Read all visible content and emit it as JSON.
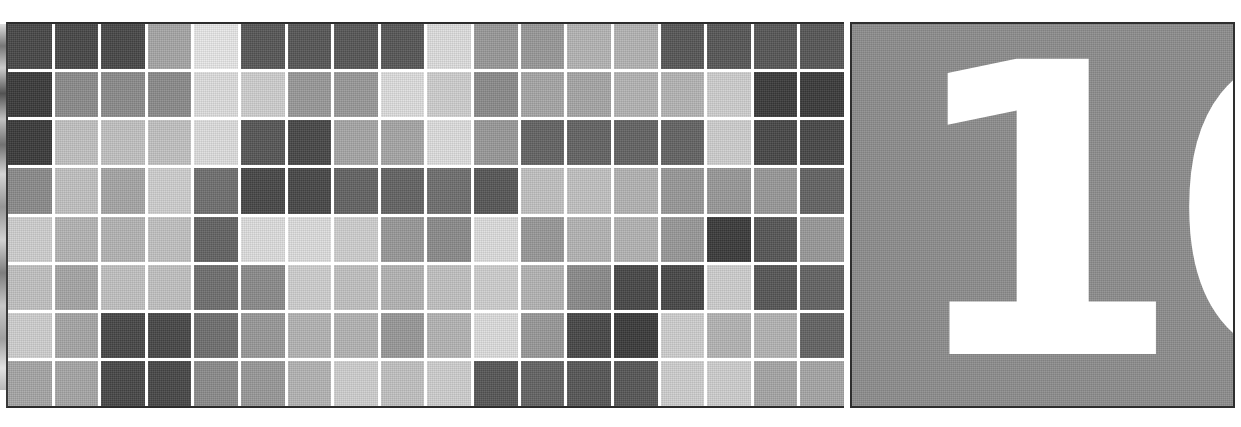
{
  "page": {
    "kind": "chapter-divider",
    "background_color": "#ffffff"
  },
  "number_panel": {
    "chapter_number": "10",
    "panel_color": "#8d8d8d",
    "number_color": "#ffffff",
    "border_color": "#2e2e2e"
  },
  "mosaic": {
    "columns": 18,
    "rows": 8,
    "gap_color": "#ffffff",
    "border_color": "#2c2c2c",
    "palette": {
      "1": "#474747",
      "2": "#565656",
      "3": "#636363",
      "4": "#6f6f6f",
      "5": "#7d7d7d",
      "6": "#8b8b8b",
      "7": "#999999",
      "8": "#a6a6a6",
      "9": "#b4b4b4",
      "10": "#c2c2c2",
      "11": "#d0d0d0",
      "12": "#dedede",
      "13": "#3a3a3a",
      "14": "#e8e8e8"
    },
    "rows_data": [
      [
        "1",
        "1",
        "1",
        "8",
        "14",
        "2",
        "2",
        "2",
        "2",
        "12",
        "7",
        "7",
        "9",
        "9",
        "2",
        "2",
        "2",
        "2"
      ],
      [
        "13",
        "6",
        "6",
        "6",
        "12",
        "11",
        "7",
        "7",
        "12",
        "11",
        "6",
        "8",
        "8",
        "9",
        "9",
        "11",
        "13",
        "13"
      ],
      [
        "13",
        "10",
        "10",
        "10",
        "12",
        "2",
        "1",
        "8",
        "8",
        "12",
        "7",
        "3",
        "3",
        "3",
        "3",
        "11",
        "1",
        "1"
      ],
      [
        "6",
        "10",
        "8",
        "11",
        "4",
        "1",
        "1",
        "3",
        "3",
        "4",
        "2",
        "10",
        "10",
        "9",
        "7",
        "7",
        "7",
        "3"
      ],
      [
        "11",
        "9",
        "9",
        "10",
        "3",
        "12",
        "12",
        "11",
        "7",
        "6",
        "12",
        "7",
        "9",
        "9",
        "7",
        "13",
        "2",
        "7"
      ],
      [
        "10",
        "8",
        "10",
        "10",
        "4",
        "6",
        "11",
        "10",
        "9",
        "10",
        "11",
        "9",
        "6",
        "1",
        "1",
        "11",
        "2",
        "3"
      ],
      [
        "11",
        "8",
        "1",
        "1",
        "4",
        "7",
        "9",
        "9",
        "7",
        "9",
        "12",
        "7",
        "1",
        "13",
        "11",
        "9",
        "9",
        "3"
      ],
      [
        "8",
        "8",
        "1",
        "1",
        "6",
        "7",
        "9",
        "11",
        "10",
        "11",
        "2",
        "3",
        "2",
        "2",
        "11",
        "11",
        "8",
        "8"
      ]
    ]
  }
}
